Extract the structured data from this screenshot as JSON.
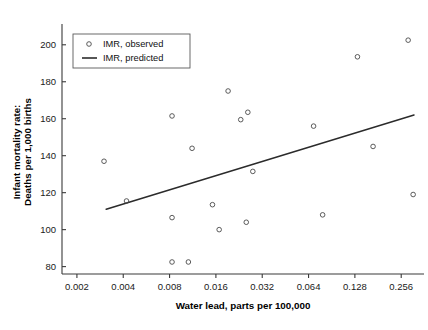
{
  "chart_data": {
    "type": "scatter",
    "title": "",
    "xlabel": "Water lead, parts per 100,000",
    "ylabel_line1": "Infant mortality rate:",
    "ylabel_line2": "Deaths per 1,000 births",
    "xscale": "log2",
    "xlim": [
      0.0016,
      0.36
    ],
    "ylim": [
      76,
      208
    ],
    "grid": false,
    "xticks": [
      0.002,
      0.004,
      0.008,
      0.016,
      0.032,
      0.064,
      0.128,
      0.256
    ],
    "xtick_labels": [
      "0.002",
      "0.004",
      "0.008",
      "0.016",
      "0.032",
      "0.064",
      "0.128",
      "0.256"
    ],
    "yticks": [
      80,
      100,
      120,
      140,
      160,
      180,
      200
    ],
    "ytick_labels": [
      "80",
      "100",
      "120",
      "140",
      "160",
      "180",
      "200"
    ],
    "legend_position": "top-left",
    "legend": [
      {
        "label": "IMR, observed",
        "marker": "circle-open",
        "color": "#4a4a4a"
      },
      {
        "label": "IMR, predicted",
        "marker": "line",
        "color": "#2b2b2b"
      }
    ],
    "series": [
      {
        "name": "IMR, observed",
        "marker": "circle-open",
        "color": "#4a4a4a",
        "points": [
          {
            "x": 0.003,
            "y": 137.0
          },
          {
            "x": 0.0042,
            "y": 115.5
          },
          {
            "x": 0.0083,
            "y": 161.5
          },
          {
            "x": 0.0083,
            "y": 106.5
          },
          {
            "x": 0.0083,
            "y": 82.5
          },
          {
            "x": 0.0106,
            "y": 82.5
          },
          {
            "x": 0.0112,
            "y": 144.0
          },
          {
            "x": 0.0152,
            "y": 113.5
          },
          {
            "x": 0.0168,
            "y": 100.0
          },
          {
            "x": 0.0192,
            "y": 175.0
          },
          {
            "x": 0.0232,
            "y": 159.5
          },
          {
            "x": 0.0258,
            "y": 163.5
          },
          {
            "x": 0.0252,
            "y": 104.0
          },
          {
            "x": 0.0278,
            "y": 131.5
          },
          {
            "x": 0.069,
            "y": 156.0
          },
          {
            "x": 0.079,
            "y": 108.0
          },
          {
            "x": 0.133,
            "y": 193.5
          },
          {
            "x": 0.168,
            "y": 145.0
          },
          {
            "x": 0.284,
            "y": 202.5
          },
          {
            "x": 0.306,
            "y": 119.0
          }
        ]
      },
      {
        "name": "IMR, predicted",
        "marker": "line",
        "color": "#2b2b2b",
        "line": [
          {
            "x": 0.0031,
            "y": 111.0
          },
          {
            "x": 0.31,
            "y": 162.0
          }
        ]
      }
    ]
  }
}
